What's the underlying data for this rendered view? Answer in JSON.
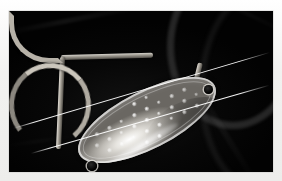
{
  "scene": {
    "subject": "fishing-spoon-lure",
    "description": "Close-up photograph of a metallic oval spoon fishing lure hanging from a bent wire arm against a black background, with two thin monofilament lines crossing the frame diagonally",
    "background_color": "#020202",
    "page_color": "#f6f6f4"
  },
  "photo": {
    "left": 9,
    "top": 11,
    "width": 264,
    "height": 161,
    "border_color": "#cfcfcd"
  },
  "lure": {
    "blade": {
      "name": "spoon-blade",
      "shape": "elongated oval",
      "finish": "polished silver metal",
      "highlight_color": "#ffffff",
      "body_color": "#bdbab4",
      "shadow_color": "#6a6762",
      "rotation_degrees": -27,
      "dimple_pattern": "regular diagonal rows of small round dimples",
      "dimple_color": "#fafafa",
      "dimple_count": 42
    },
    "eyelets": [
      {
        "name": "top-eyelet",
        "position": "upper-right end of blade",
        "color": "#000000"
      },
      {
        "name": "bottom-eyelet",
        "position": "lower-left end of blade",
        "color": "#000000"
      }
    ],
    "wire": {
      "name": "wire-arm",
      "color": "#b7b2a8",
      "segments": [
        "top-arm",
        "left-shank",
        "lower-bend",
        "upper-arch",
        "arch-tail"
      ],
      "joint": "corner-knuckle"
    }
  },
  "lines": [
    {
      "name": "monofilament-line-upper",
      "color": "#ffffff",
      "angle_degrees": -16.5
    },
    {
      "name": "monofilament-line-lower",
      "color": "#ffffff",
      "angle_degrees": -16.0
    }
  ],
  "background_features": [
    {
      "name": "background-arc-outer",
      "description": "faint dark curved arc in upper right"
    },
    {
      "name": "background-arc-inner",
      "description": "second faint arc behind the first"
    },
    {
      "name": "background-streak-top-left",
      "description": "soft grey streak across upper left"
    },
    {
      "name": "background-streak-right",
      "description": "soft diagonal streak on the right side"
    }
  ]
}
